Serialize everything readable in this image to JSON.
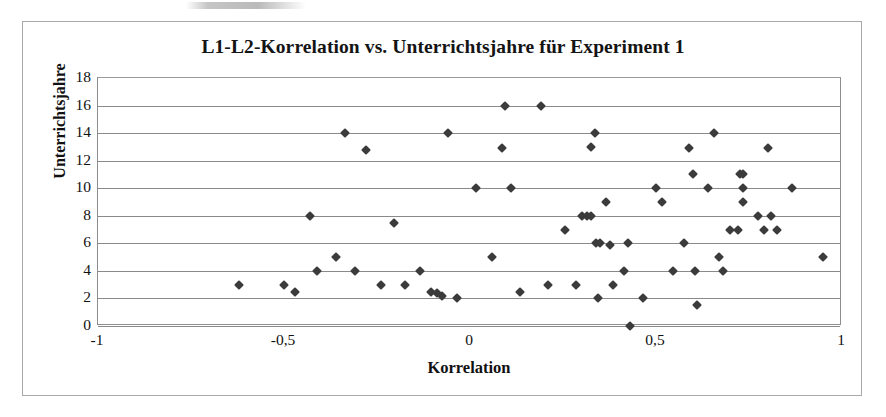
{
  "chart_data": {
    "type": "scatter",
    "title": "L1-L2-Korrelation vs. Unterrichtsjahre für Experiment 1",
    "xlabel": "Korrelation",
    "ylabel": "Unterrichtsjahre",
    "xlim": [
      -1,
      1
    ],
    "ylim": [
      0,
      18
    ],
    "grid": "horizontal",
    "legend": "none",
    "marker": "diamond",
    "marker_color": "#3b3b3b",
    "xticks": [
      -1,
      -0.5,
      0,
      0.5,
      1
    ],
    "xtick_labels": [
      "-1",
      "-0,5",
      "0",
      "0,5",
      "1"
    ],
    "yticks": [
      0,
      2,
      4,
      6,
      8,
      10,
      12,
      14,
      16,
      18
    ],
    "ytick_labels": [
      "0",
      "2",
      "4",
      "6",
      "8",
      "10",
      "12",
      "14",
      "16",
      "18"
    ],
    "points": [
      [
        -0.62,
        3
      ],
      [
        -0.5,
        3
      ],
      [
        -0.47,
        2.5
      ],
      [
        -0.43,
        8
      ],
      [
        -0.41,
        4
      ],
      [
        -0.36,
        5
      ],
      [
        -0.335,
        14
      ],
      [
        -0.31,
        4
      ],
      [
        -0.28,
        12.8
      ],
      [
        -0.24,
        3
      ],
      [
        -0.205,
        7.5
      ],
      [
        -0.175,
        3
      ],
      [
        -0.135,
        4
      ],
      [
        -0.105,
        2.5
      ],
      [
        -0.09,
        2.4
      ],
      [
        -0.075,
        2.2
      ],
      [
        -0.06,
        14
      ],
      [
        -0.035,
        2
      ],
      [
        0.015,
        10
      ],
      [
        0.06,
        5
      ],
      [
        0.085,
        12.9
      ],
      [
        0.095,
        16
      ],
      [
        0.11,
        10
      ],
      [
        0.135,
        2.5
      ],
      [
        0.19,
        16
      ],
      [
        0.21,
        3
      ],
      [
        0.255,
        7
      ],
      [
        0.285,
        3
      ],
      [
        0.3,
        8
      ],
      [
        0.315,
        8
      ],
      [
        0.325,
        8
      ],
      [
        0.325,
        13
      ],
      [
        0.335,
        14
      ],
      [
        0.34,
        6
      ],
      [
        0.345,
        2
      ],
      [
        0.35,
        6
      ],
      [
        0.365,
        9
      ],
      [
        0.375,
        5.9
      ],
      [
        0.385,
        3
      ],
      [
        0.415,
        4
      ],
      [
        0.425,
        6
      ],
      [
        0.43,
        0
      ],
      [
        0.465,
        2
      ],
      [
        0.5,
        10
      ],
      [
        0.515,
        9
      ],
      [
        0.545,
        4
      ],
      [
        0.575,
        6
      ],
      [
        0.59,
        12.9
      ],
      [
        0.6,
        11
      ],
      [
        0.605,
        4
      ],
      [
        0.61,
        1.5
      ],
      [
        0.64,
        10
      ],
      [
        0.655,
        14
      ],
      [
        0.67,
        5
      ],
      [
        0.68,
        4
      ],
      [
        0.7,
        7
      ],
      [
        0.72,
        7
      ],
      [
        0.725,
        11
      ],
      [
        0.735,
        11
      ],
      [
        0.735,
        10
      ],
      [
        0.735,
        9
      ],
      [
        0.775,
        8
      ],
      [
        0.79,
        7
      ],
      [
        0.8,
        12.9
      ],
      [
        0.81,
        8
      ],
      [
        0.825,
        7
      ],
      [
        0.865,
        10
      ],
      [
        0.95,
        5
      ]
    ]
  }
}
